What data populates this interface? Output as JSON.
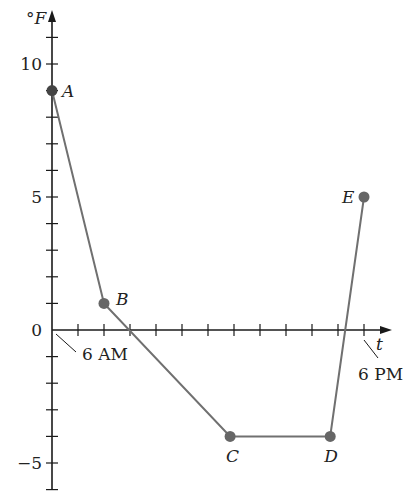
{
  "chart_data": {
    "type": "line",
    "title": "",
    "xlabel": "t",
    "ylabel": "°F",
    "x_tick_labels": [
      {
        "t": 0,
        "label": "6 AM"
      },
      {
        "t": 12,
        "label": "6 PM"
      }
    ],
    "y_tick_labels": [
      {
        "value": 10,
        "label": "10"
      },
      {
        "value": 5,
        "label": "5"
      },
      {
        "value": 0,
        "label": "0"
      },
      {
        "value": -5,
        "label": "−5"
      }
    ],
    "xlim": [
      0,
      12.6
    ],
    "ylim": [
      -6,
      11.6
    ],
    "x_tick_step": 1,
    "y_tick_step": 1,
    "grid": false,
    "series": [
      {
        "name": "Temperature",
        "color": "#707070",
        "points": [
          {
            "label": "A",
            "t": 0,
            "value": 9
          },
          {
            "label": "B",
            "t": 2,
            "value": 1
          },
          {
            "label": "C",
            "t": 6.85,
            "value": -4
          },
          {
            "label": "D",
            "t": 10.7,
            "value": -4
          },
          {
            "label": "E",
            "t": 12,
            "value": 5
          }
        ]
      }
    ]
  },
  "colors": {
    "axis": "#1a1a1a",
    "line": "#707070",
    "point": "#666666"
  }
}
